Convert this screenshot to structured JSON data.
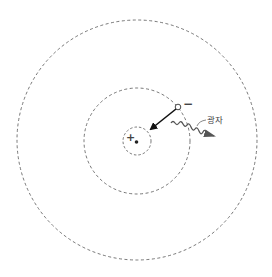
{
  "diagram": {
    "title": "",
    "nucleus": {
      "charge_symbol": "+",
      "cx": 137,
      "cy": 141
    },
    "orbits": [
      {
        "name": "inner-orbit",
        "r": 14
      },
      {
        "name": "middle-orbit",
        "r": 53
      },
      {
        "name": "outer-orbit",
        "r": 120
      }
    ],
    "electron": {
      "charge_symbol": "−",
      "cx": 178,
      "cy": 107
    },
    "photon": {
      "label": "광자"
    },
    "colors": {
      "line": "#555555",
      "arrow": "#111111",
      "photon_arrow": "#444444"
    }
  }
}
